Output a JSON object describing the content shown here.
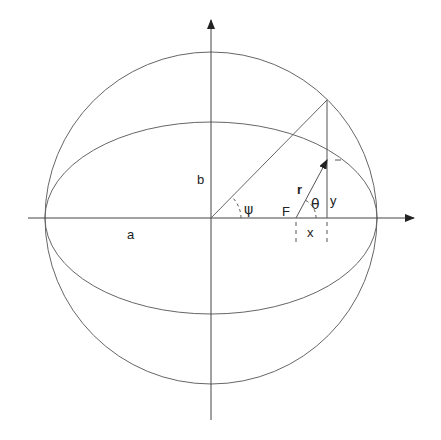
{
  "figure": {
    "colors": {
      "stroke": "#555555",
      "axis": "#333333",
      "text": "#222222",
      "background": "#ffffff"
    },
    "geometry": {
      "center": [
        211,
        218
      ],
      "circle_radius": 166,
      "ellipse_semi_major": 166,
      "ellipse_semi_minor": 96,
      "focus": [
        296,
        218
      ],
      "point_on_ellipse": [
        327,
        160
      ],
      "point_on_circle": [
        327,
        100
      ]
    },
    "labels": {
      "a": "a",
      "b": "b",
      "r": "r",
      "psi": "ψ",
      "theta": "θ",
      "F": "F",
      "x": "x",
      "y": "y"
    }
  }
}
